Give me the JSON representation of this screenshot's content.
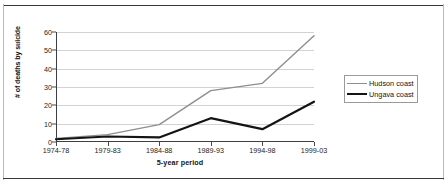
{
  "chart_data": {
    "type": "line",
    "title": "",
    "xlabel": "5-year period",
    "ylabel": "# of deaths by suicide",
    "categories": [
      "1974-78",
      "1979-83",
      "1984-88",
      "1989-93",
      "1994-98",
      "1999-03"
    ],
    "series": [
      {
        "name": "Hudson coast",
        "values": [
          2,
          4,
          9.5,
          28,
          32,
          58
        ],
        "color": "#8e8e8e",
        "width": 1.4
      },
      {
        "name": "Ungava coast",
        "values": [
          1.5,
          3,
          2.5,
          13,
          7,
          22
        ],
        "color": "#141414",
        "width": 2.2
      }
    ],
    "ylim": [
      0,
      60
    ],
    "yticks": [
      0,
      10,
      20,
      30,
      40,
      50,
      60
    ],
    "ytick_labels": [
      "0",
      "10",
      "20",
      "30",
      "40",
      "50",
      "60"
    ],
    "grid": true,
    "legend_position": "right"
  },
  "legend": {
    "entries": [
      {
        "label": "Hudson coast"
      },
      {
        "label": "Ungava coast"
      }
    ]
  }
}
